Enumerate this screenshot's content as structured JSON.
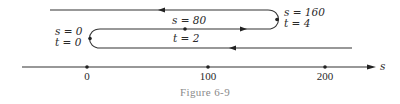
{
  "figure": {
    "caption": "Figure 6-9",
    "axis": {
      "label": "s",
      "ticks": [
        {
          "value": 0,
          "label": "0"
        },
        {
          "value": 100,
          "label": "100"
        },
        {
          "value": 200,
          "label": "200"
        }
      ]
    },
    "annotations": [
      {
        "id": "start",
        "s_text": "s = 0",
        "t_text": "t = 0",
        "s": 0,
        "t": 0
      },
      {
        "id": "mid",
        "s_text": "s = 80",
        "t_text": "t = 2",
        "s": 80,
        "t": 2
      },
      {
        "id": "turn",
        "s_text": "s = 160",
        "t_text": "t = 4",
        "s": 160,
        "t": 4
      }
    ],
    "path_segments": [
      {
        "name": "segment-outbound",
        "from_s": 0,
        "to_s": 160,
        "direction": "right"
      },
      {
        "name": "segment-return",
        "from_s": 160,
        "to_s": -30,
        "direction": "left"
      },
      {
        "name": "segment-lower",
        "from_s": 0,
        "to_s": 220,
        "direction": "left"
      }
    ]
  }
}
